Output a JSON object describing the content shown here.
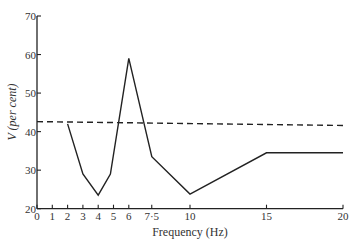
{
  "chart_data": {
    "type": "line",
    "title": "",
    "xlabel": "Frequency (Hz)",
    "ylabel": "V (per cent)",
    "xlim": [
      0,
      20
    ],
    "ylim": [
      20,
      70
    ],
    "x_ticks": [
      0,
      1,
      2,
      3,
      4,
      5,
      6,
      7.5,
      10,
      15,
      20
    ],
    "x_tick_labels": [
      "0",
      "1",
      "2",
      "3",
      "4",
      "5",
      "6",
      "7·5",
      "10",
      "15",
      "20"
    ],
    "y_ticks": [
      20,
      30,
      40,
      50,
      60,
      70
    ],
    "y_tick_labels": [
      "20",
      "30",
      "40",
      "50",
      "60",
      "70"
    ],
    "grid": false,
    "series": [
      {
        "name": "V",
        "style": "solid",
        "color": "#222222",
        "x": [
          2,
          3,
          4,
          4.8,
          6,
          7.5,
          10,
          15,
          20
        ],
        "y": [
          42,
          29,
          23.5,
          29,
          59,
          33.5,
          23.8,
          34.5,
          34.5
        ]
      },
      {
        "name": "reference",
        "style": "dashed",
        "color": "#222222",
        "x": [
          0,
          20
        ],
        "y": [
          42.6,
          41.6
        ]
      }
    ]
  }
}
